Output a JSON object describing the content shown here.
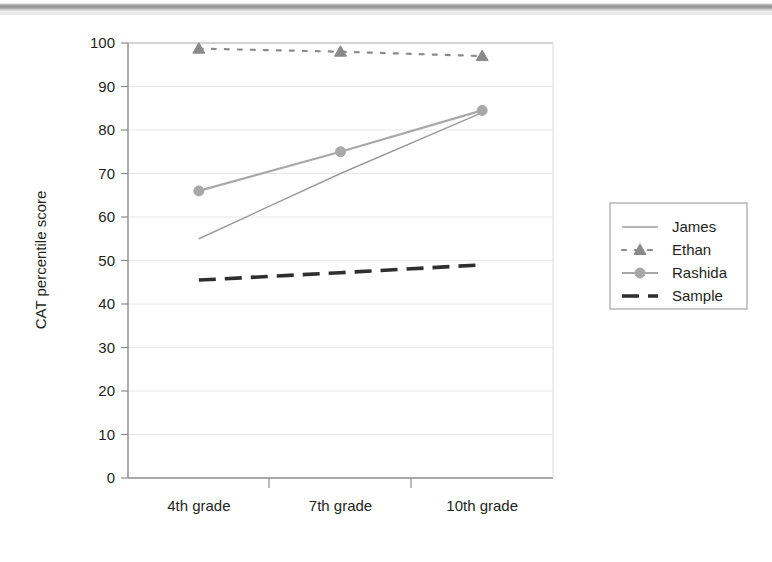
{
  "figure": {
    "background_color": "#ffffff",
    "scan_band": "top-gray-rule"
  },
  "chart_data": {
    "type": "line",
    "title": "",
    "xlabel": "",
    "ylabel": "CAT percentile score",
    "categories": [
      "4th grade",
      "7th grade",
      "10th grade"
    ],
    "ylim": [
      0,
      100
    ],
    "yticks": [
      0,
      10,
      20,
      30,
      40,
      50,
      60,
      70,
      80,
      90,
      100
    ],
    "ytick_labels": [
      "0",
      "10",
      "20",
      "30",
      "40",
      "50",
      "60",
      "70",
      "80",
      "90",
      "100"
    ],
    "grid": "horizontal",
    "legend_position": "right",
    "series": [
      {
        "name": "James",
        "values": [
          55,
          70,
          84
        ],
        "color": "#9b9b9b",
        "style": "solid-thin",
        "marker": "none",
        "width": 1.4
      },
      {
        "name": "Ethan",
        "values": [
          98.7,
          98,
          97
        ],
        "color": "#8a8a8a",
        "style": "dotted",
        "marker": "triangle",
        "width": 2.2
      },
      {
        "name": "Rashida",
        "values": [
          66,
          75,
          84.5
        ],
        "color": "#a8a8a8",
        "style": "solid",
        "marker": "circle",
        "width": 2.2
      },
      {
        "name": "Sample",
        "values": [
          45.5,
          47.2,
          49
        ],
        "color": "#2f2f2f",
        "style": "dashed-thick",
        "marker": "none",
        "width": 3.6
      }
    ]
  },
  "legend": {
    "items": [
      {
        "label": "James"
      },
      {
        "label": "Ethan"
      },
      {
        "label": "Rashida"
      },
      {
        "label": "Sample"
      }
    ]
  },
  "axes": {
    "y_title": "CAT percentile score",
    "plot_border_color": "#bdbdbd",
    "grid_color": "#e8e8e8"
  }
}
